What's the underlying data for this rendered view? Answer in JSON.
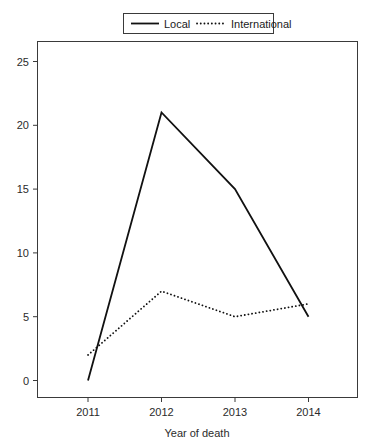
{
  "chart_data": {
    "type": "line",
    "title": "",
    "xlabel": "Year of death",
    "ylabel": "",
    "categories": [
      "2011",
      "2012",
      "2013",
      "2014"
    ],
    "x": [
      2011,
      2012,
      2013,
      2014
    ],
    "series": [
      {
        "name": "Local",
        "style": "solid",
        "values": [
          0,
          21,
          15,
          5
        ]
      },
      {
        "name": "International",
        "style": "dotted",
        "values": [
          2,
          7,
          5,
          6
        ]
      }
    ],
    "xtick_labels": [
      "2011",
      "2012",
      "2013",
      "2014"
    ],
    "ytick_labels": [
      "0",
      "5",
      "10",
      "15",
      "20",
      "25"
    ],
    "ytick_values": [
      0,
      5,
      10,
      15,
      20,
      25
    ],
    "ylim": [
      0,
      26.5
    ],
    "xlim": [
      2010.6,
      2014.65
    ],
    "grid": false,
    "legend_position": "top-center",
    "legend_entries": [
      "Local",
      "International"
    ],
    "frame": true,
    "line_color": "#111111"
  },
  "legend": {
    "local_label": "Local",
    "international_label": "International"
  },
  "axes": {
    "x_title": "Year of death",
    "x_ticks": [
      "2011",
      "2012",
      "2013",
      "2014"
    ],
    "y_ticks": [
      "0",
      "5",
      "10",
      "15",
      "20",
      "25"
    ]
  }
}
